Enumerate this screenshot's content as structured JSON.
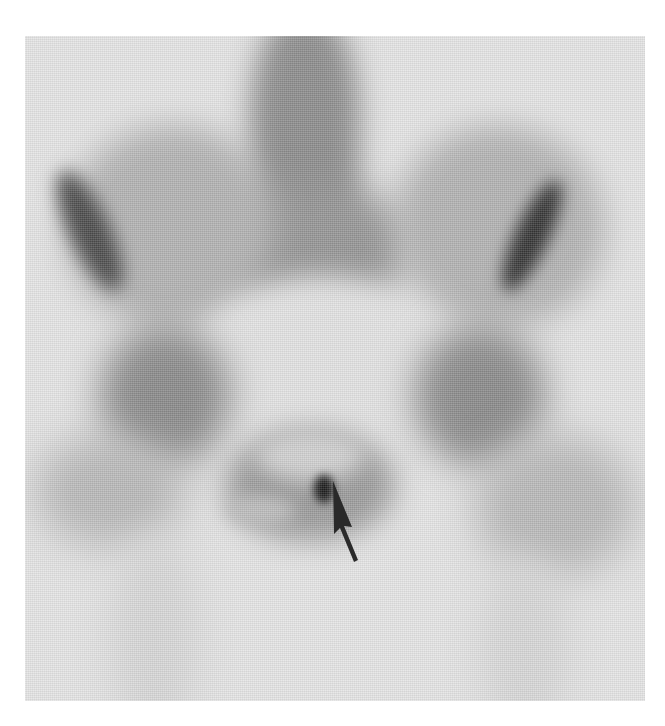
{
  "image": {
    "type": "bone scintigraphy",
    "view": "anterior pelvis",
    "colormap": "grayscale (dark = increased uptake)",
    "background_color": "#e4e4e4",
    "uptake_color": "#3a3a3a",
    "hotspot_color": "#1a1a1a"
  },
  "structures": [
    {
      "name": "lower lumbar spine",
      "position": "top center"
    },
    {
      "name": "sacrum",
      "position": "center"
    },
    {
      "name": "right iliac wing",
      "position": "upper left",
      "note": "dark rim along iliac crest"
    },
    {
      "name": "left iliac wing",
      "position": "upper right",
      "note": "dark rim along iliac crest"
    },
    {
      "name": "right acetabulum / hip",
      "position": "middle left"
    },
    {
      "name": "left acetabulum / hip",
      "position": "middle right"
    },
    {
      "name": "pubic symphysis",
      "position": "lower center",
      "note": "focal hot spot"
    },
    {
      "name": "proximal femora",
      "position": "bottom, faint"
    }
  ],
  "annotations": [
    {
      "type": "arrow",
      "color": "#2a2a2a",
      "points_to": "focal uptake at pubic symphysis",
      "tip": [
        331,
        481
      ],
      "tail": [
        357,
        560
      ]
    }
  ]
}
